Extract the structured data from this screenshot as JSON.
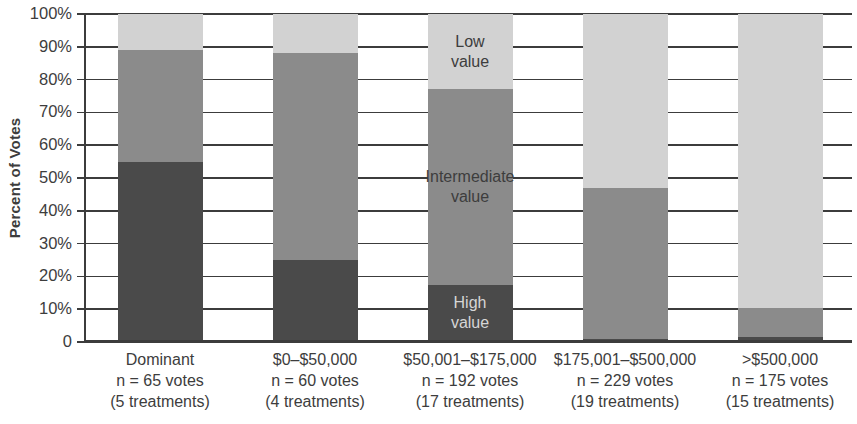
{
  "chart_data": {
    "type": "bar",
    "stacked": true,
    "title": "",
    "ylabel": "Percent of Votes",
    "xlabel": "",
    "ylim": [
      0,
      100
    ],
    "grid": true,
    "legend": "in-bar annotations on third bar",
    "ytick_labels": [
      "100%",
      "90%",
      "80%",
      "70%",
      "60%",
      "50%",
      "40%",
      "30%",
      "20%",
      "10%",
      "0"
    ],
    "categories": [
      {
        "lines": [
          "Dominant",
          "n = 65 votes",
          "(5 treatments)"
        ]
      },
      {
        "lines": [
          "$0–$50,000",
          "n = 60 votes",
          "(4 treatments)"
        ]
      },
      {
        "lines": [
          "$50,001–$175,000",
          "n = 192 votes",
          "(17 treatments)"
        ]
      },
      {
        "lines": [
          "$175,001–$500,000",
          "n = 229 votes",
          "(19 treatments)"
        ]
      },
      {
        "lines": [
          ">$500,000",
          "n = 175 votes",
          "(15 treatments)"
        ]
      }
    ],
    "series": [
      {
        "name": "High value",
        "label_lines": [
          "High",
          "value"
        ],
        "color": "#4a4a4a",
        "label_color": "#d6d6d6",
        "values": [
          55,
          25,
          17.5,
          1,
          1.5
        ]
      },
      {
        "name": "Intermediate value",
        "label_lines": [
          "Intermediate",
          "value"
        ],
        "color": "#8b8b8b",
        "label_color": "#3d3d3d",
        "values": [
          34,
          63,
          59.5,
          46,
          9
        ]
      },
      {
        "name": "Low value",
        "label_lines": [
          "Low",
          "value"
        ],
        "color": "#d2d2d2",
        "label_color": "#3d3d3d",
        "values": [
          11,
          12,
          23,
          53,
          89.5
        ]
      }
    ],
    "annotation_bar_index": 2,
    "colors": {
      "grid": "#3c3c3c",
      "axis": "#3c3c3c",
      "text": "#3d3d3d",
      "background": "#ffffff"
    }
  }
}
